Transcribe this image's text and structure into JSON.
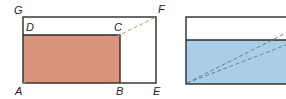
{
  "figure_left": {
    "labels": {
      "G": "G",
      "D": "D",
      "C": "C",
      "F": "F",
      "A": "A",
      "B": "B",
      "E": "E"
    },
    "colors": {
      "outline": "#2b2b2b",
      "fill": "#d9967c",
      "diagonal": "#d98a72"
    }
  },
  "figure_right": {
    "colors": {
      "outline": "#2b2b2b",
      "fill": "#a9cfe8",
      "diagonal": "#6f7f8a"
    }
  }
}
